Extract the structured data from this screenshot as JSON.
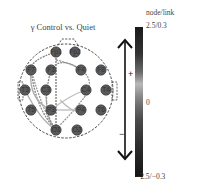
{
  "title": "γ Control vs. Quiet",
  "head": {
    "electrodes": [
      {
        "id": "Fp1",
        "x": 56,
        "y": 52
      },
      {
        "id": "Fp2",
        "x": 75,
        "y": 52
      },
      {
        "id": "F7",
        "x": 31,
        "y": 70
      },
      {
        "id": "F3",
        "x": 51,
        "y": 70
      },
      {
        "id": "F4",
        "x": 81,
        "y": 70
      },
      {
        "id": "F8",
        "x": 101,
        "y": 70
      },
      {
        "id": "T3",
        "x": 25,
        "y": 90
      },
      {
        "id": "C3",
        "x": 46,
        "y": 90
      },
      {
        "id": "C4",
        "x": 86,
        "y": 90
      },
      {
        "id": "T4",
        "x": 106,
        "y": 90
      },
      {
        "id": "T5",
        "x": 31,
        "y": 110
      },
      {
        "id": "P3",
        "x": 51,
        "y": 110
      },
      {
        "id": "P4",
        "x": 81,
        "y": 110
      },
      {
        "id": "T6",
        "x": 101,
        "y": 110
      },
      {
        "id": "O1",
        "x": 56,
        "y": 130
      },
      {
        "id": "O2",
        "x": 77,
        "y": 130
      }
    ]
  },
  "arrow": {
    "plus_label": "+",
    "minus_label": "−"
  },
  "colorbar": {
    "header": "node/link",
    "max_label": "2.5/0.3",
    "mid_label": "0",
    "min_label": "−2.5/−0.3"
  }
}
